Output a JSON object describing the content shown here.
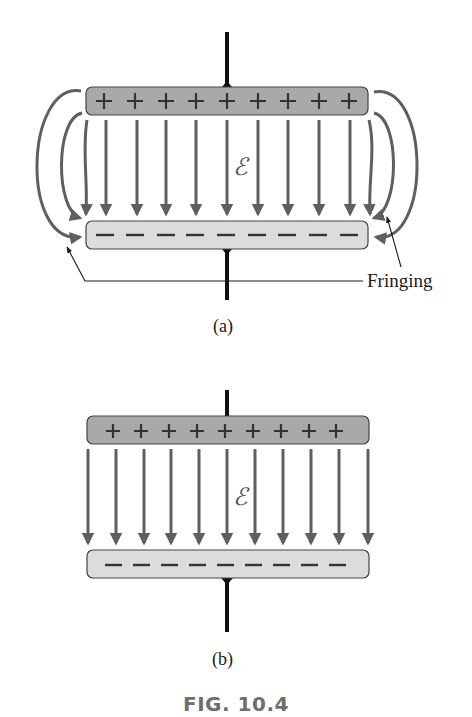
{
  "figure": {
    "caption": "FIG. 10.4",
    "panels": [
      {
        "id": "a",
        "label": "(a)",
        "field_symbol": "ℰ",
        "top_plate_charges": [
          "+",
          "+",
          "+",
          "+",
          "+",
          "+",
          "+",
          "+",
          "+"
        ],
        "bottom_plate_charges": [
          "−",
          "−",
          "−",
          "−",
          "−",
          "−",
          "−",
          "−",
          "−"
        ],
        "annotation": "Fringing"
      },
      {
        "id": "b",
        "label": "(b)",
        "field_symbol": "ℰ",
        "top_plate_charges": [
          "+",
          "+",
          "+",
          "+",
          "+",
          "+",
          "+",
          "+",
          "+"
        ],
        "bottom_plate_charges": [
          "−",
          "−",
          "−",
          "−",
          "−",
          "−",
          "−",
          "−",
          "−"
        ]
      }
    ]
  },
  "colors": {
    "top_plate": "#a9a9a9",
    "bottom_plate": "#dcdcdc",
    "field_line": "#5f5f5f",
    "lead": "#111111"
  }
}
